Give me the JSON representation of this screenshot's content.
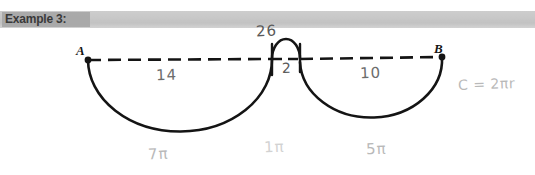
{
  "page": {
    "background_color": "#ffffff",
    "width": 535,
    "height": 175
  },
  "header": {
    "label": "Example 3:",
    "banner_color": "#c5c5c5",
    "highlight_color": "#a8a8a8",
    "text_color": "#3a3a3a"
  },
  "diagram": {
    "type": "geometry-figure",
    "line_style": "dashed",
    "ink_color": "#141414",
    "pencil_color": "#6d6d6d",
    "endpoints": [
      {
        "name": "A",
        "label": "A",
        "x": 88,
        "y": 60
      },
      {
        "name": "B",
        "label": "B",
        "x": 442,
        "y": 57
      }
    ],
    "segments": [
      {
        "name": "left-segment",
        "length_label": "14"
      },
      {
        "name": "middle-segment",
        "length_label": "2"
      },
      {
        "name": "right-segment",
        "length_label": "10"
      }
    ],
    "arcs": [
      {
        "name": "left-arc",
        "orientation": "below",
        "diameter_label": "14",
        "arc_length_label": "7π"
      },
      {
        "name": "middle-arc",
        "orientation": "above",
        "diameter_label": "2",
        "arc_length_label": "1π"
      },
      {
        "name": "right-arc",
        "orientation": "below",
        "diameter_label": "10",
        "arc_length_label": "5π"
      }
    ]
  },
  "annotations": {
    "total_length": "26",
    "left_diameter": "14",
    "middle_diameter": "2",
    "right_diameter": "10",
    "left_arc_length": "7π",
    "middle_arc_length": "1π",
    "right_arc_length": "5π",
    "formula": "C = 2πr"
  }
}
